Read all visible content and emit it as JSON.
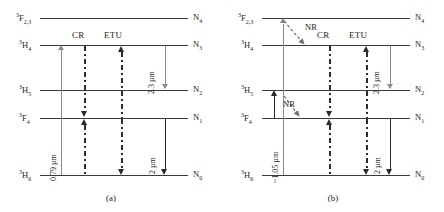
{
  "figure": {
    "type": "energy-level-diagram",
    "panels": [
      {
        "id": "a",
        "caption": "(a)",
        "levels": [
          {
            "term_sup": "3",
            "term_main": "F",
            "term_sub": "2,3",
            "n_label": "N",
            "n_sub": "4",
            "y": 18
          },
          {
            "term_sup": "3",
            "term_main": "H",
            "term_sub": "4",
            "n_label": "N",
            "n_sub": "3",
            "y": 45
          },
          {
            "term_sup": "3",
            "term_main": "H",
            "term_sub": "5",
            "n_label": "N",
            "n_sub": "2",
            "y": 90
          },
          {
            "term_sup": "3",
            "term_main": "F",
            "term_sub": "4",
            "n_label": "N",
            "n_sub": "1",
            "y": 118
          },
          {
            "term_sup": "3",
            "term_main": "H",
            "term_sub": "6",
            "n_label": "N",
            "n_sub": "0",
            "y": 175
          }
        ],
        "transitions": [
          {
            "name": "pump",
            "label": "0.79 µm",
            "style": "solid-gray",
            "direction": "up",
            "from": "N0",
            "to": "N3"
          },
          {
            "name": "cross-relaxation",
            "label": "CR",
            "style": "dash-dot",
            "direction": "both"
          },
          {
            "name": "energy-transfer-upconversion",
            "label": "ETU",
            "style": "dash-dot",
            "direction": "both"
          },
          {
            "name": "emission-2p3",
            "label": "2.3 µm",
            "style": "solid-gray",
            "direction": "down",
            "from": "N3",
            "to": "N2"
          },
          {
            "name": "emission-2",
            "label": "2 µm",
            "style": "solid-black",
            "direction": "down",
            "from": "N1",
            "to": "N0"
          }
        ]
      },
      {
        "id": "b",
        "caption": "(b)",
        "levels": [
          {
            "term_sup": "3",
            "term_main": "F",
            "term_sub": "2,3",
            "n_label": "N",
            "n_sub": "4",
            "y": 18
          },
          {
            "term_sup": "3",
            "term_main": "H",
            "term_sub": "4",
            "n_label": "N",
            "n_sub": "3",
            "y": 45
          },
          {
            "term_sup": "3",
            "term_main": "H",
            "term_sub": "5",
            "n_label": "N",
            "n_sub": "2",
            "y": 90
          },
          {
            "term_sup": "3",
            "term_main": "F",
            "term_sub": "4",
            "n_label": "N",
            "n_sub": "1",
            "y": 118
          },
          {
            "term_sup": "3",
            "term_main": "H",
            "term_sub": "6",
            "n_label": "N",
            "n_sub": "0",
            "y": 175
          }
        ],
        "transitions": [
          {
            "name": "pump",
            "label": "~1.05 µm",
            "style": "solid-gray",
            "direction": "up",
            "from": "N0",
            "to": "N4"
          },
          {
            "name": "nonradiative-upper",
            "label": "NR",
            "style": "dashed-diagonal",
            "direction": "down",
            "from": "N4",
            "to": "N3"
          },
          {
            "name": "nonradiative-lower",
            "label": "NR",
            "style": "dashed-diagonal",
            "direction": "down",
            "from": "N2",
            "to": "N1"
          },
          {
            "name": "cross-relaxation",
            "label": "CR",
            "style": "dash-dot",
            "direction": "both"
          },
          {
            "name": "energy-transfer-upconversion",
            "label": "ETU",
            "style": "dash-dot",
            "direction": "both"
          },
          {
            "name": "emission-2p3",
            "label": "2.3 µm",
            "style": "solid-gray",
            "direction": "down",
            "from": "N3",
            "to": "N2"
          },
          {
            "name": "emission-2",
            "label": "2 µm",
            "style": "solid-black",
            "direction": "down",
            "from": "N1",
            "to": "N0"
          }
        ]
      }
    ]
  },
  "a": {
    "caption": "(a)",
    "lvl4": {
      "sup": "3",
      "main": "F",
      "sub": "2,3",
      "n": "N",
      "nsub": "4"
    },
    "lvl3": {
      "sup": "3",
      "main": "H",
      "sub": "4",
      "n": "N",
      "nsub": "3"
    },
    "lvl2": {
      "sup": "3",
      "main": "H",
      "sub": "5",
      "n": "N",
      "nsub": "2"
    },
    "lvl1": {
      "sup": "3",
      "main": "F",
      "sub": "4",
      "n": "N",
      "nsub": "1"
    },
    "lvl0": {
      "sup": "3",
      "main": "H",
      "sub": "6",
      "n": "N",
      "nsub": "0"
    },
    "cr": "CR",
    "etu": "ETU",
    "pump": "0.79 µm",
    "em23": "2.3 µm",
    "em2": "2 µm"
  },
  "b": {
    "caption": "(b)",
    "lvl4": {
      "sup": "3",
      "main": "F",
      "sub": "2,3",
      "n": "N",
      "nsub": "4"
    },
    "lvl3": {
      "sup": "3",
      "main": "H",
      "sub": "4",
      "n": "N",
      "nsub": "3"
    },
    "lvl2": {
      "sup": "3",
      "main": "H",
      "sub": "5",
      "n": "N",
      "nsub": "2"
    },
    "lvl1": {
      "sup": "3",
      "main": "F",
      "sub": "4",
      "n": "N",
      "nsub": "1"
    },
    "lvl0": {
      "sup": "3",
      "main": "H",
      "sub": "6",
      "n": "N",
      "nsub": "0"
    },
    "cr": "CR",
    "etu": "ETU",
    "nr1": "NR",
    "nr2": "NR",
    "pump": "~1.05 µm",
    "em23": "2.3 µm",
    "em2": "2 µm"
  },
  "colors": {
    "level_line": "#3a3a3a",
    "gray_arrow": "#8a8a8a",
    "black_arrow": "#2b2b2b",
    "text": "#231f20",
    "background": "#ffffff"
  }
}
